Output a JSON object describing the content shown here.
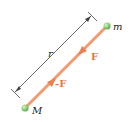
{
  "diagram": {
    "masses": [
      {
        "id": "m",
        "label": "m",
        "color": "#8fcf7a"
      },
      {
        "id": "M",
        "label": "M",
        "color": "#8fcf7a"
      }
    ],
    "forces": [
      {
        "id": "F",
        "label": "F",
        "on": "m",
        "direction": "toward M"
      },
      {
        "id": "negF",
        "label": "-F",
        "on": "M",
        "direction": "toward m"
      }
    ],
    "distance": {
      "label": "r"
    },
    "colors": {
      "force": "#f08a5d",
      "force_label": "#e8743f",
      "dimension": "#333333",
      "sphere": "#8fcf7a",
      "text": "#222222"
    }
  }
}
